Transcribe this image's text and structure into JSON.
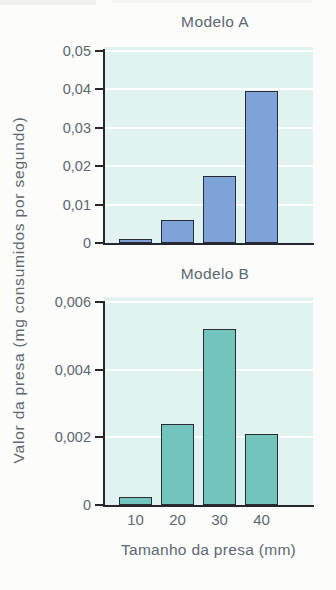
{
  "figure": {
    "background": "#fcfcfb",
    "plot_background": "#e1f3f0",
    "axis_color": "#26262e",
    "text_color": "#5d6872",
    "gridline_color": "#ffffff"
  },
  "labels": {
    "y_axis": "Valor da presa (mg consumidos por segundo)",
    "x_axis": "Tamanho da presa (mm)"
  },
  "chart_data": [
    {
      "type": "bar",
      "title": "Modelo A",
      "categories": [
        "10",
        "20",
        "30",
        "40"
      ],
      "values": [
        0.001,
        0.006,
        0.0175,
        0.0395
      ],
      "xlabel": "Tamanho da presa (mm)",
      "ylabel": "Valor da presa (mg consumidos por segundo)",
      "ylim": [
        0,
        0.05
      ],
      "yticks": [
        0,
        0.01,
        0.02,
        0.03,
        0.04,
        0.05
      ],
      "ytick_labels": [
        "0",
        "0,01",
        "0,02",
        "0,03",
        "0,04",
        "0,05"
      ],
      "bar_color": "#7ea3d8",
      "bar_border_color": "#2b2b33",
      "grid": true,
      "show_x_tick_labels": false,
      "legend": "none"
    },
    {
      "type": "bar",
      "title": "Modelo B",
      "categories": [
        "10",
        "20",
        "30",
        "40"
      ],
      "values": [
        0.00025,
        0.0024,
        0.0052,
        0.0021
      ],
      "xlabel": "Tamanho da presa (mm)",
      "ylabel": "Valor da presa (mg consumidos por segundo)",
      "ylim": [
        0,
        0.006
      ],
      "yticks": [
        0,
        0.002,
        0.004,
        0.006
      ],
      "ytick_labels": [
        "0",
        "0,002",
        "0,004",
        "0,006"
      ],
      "bar_color": "#72c5bd",
      "bar_border_color": "#2b2b33",
      "grid": true,
      "show_x_tick_labels": true,
      "legend": "none"
    }
  ]
}
